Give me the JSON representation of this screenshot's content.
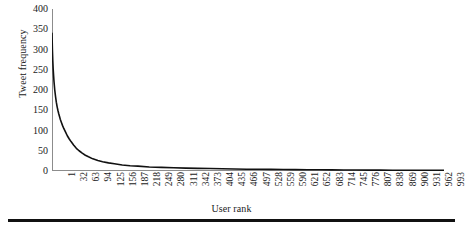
{
  "chart_data": {
    "type": "line",
    "title": "",
    "xlabel": "User rank",
    "ylabel": "Tweet frequency",
    "ylim": [
      0,
      400
    ],
    "xlim": [
      1,
      1000
    ],
    "grid": false,
    "legend": null,
    "yticks": [
      0,
      50,
      100,
      150,
      200,
      250,
      300,
      350,
      400
    ],
    "ytick_labels": [
      "0",
      "50",
      "100",
      "150",
      "200",
      "250",
      "300",
      "350",
      "400"
    ],
    "xtick_labels": [
      "1",
      "32",
      "63",
      "94",
      "125",
      "156",
      "187",
      "218",
      "249",
      "280",
      "311",
      "342",
      "373",
      "404",
      "435",
      "466",
      "497",
      "528",
      "559",
      "590",
      "621",
      "652",
      "683",
      "714",
      "745",
      "776",
      "807",
      "838",
      "869",
      "900",
      "931",
      "962",
      "993"
    ],
    "xtick_values": [
      1,
      32,
      63,
      94,
      125,
      156,
      187,
      218,
      249,
      280,
      311,
      342,
      373,
      404,
      435,
      466,
      497,
      528,
      559,
      590,
      621,
      652,
      683,
      714,
      745,
      776,
      807,
      838,
      869,
      900,
      931,
      962,
      993
    ],
    "series": [
      {
        "name": "Tweet frequency by user rank",
        "color": "#111111",
        "line_width": 1.6,
        "x": [
          1,
          2,
          3,
          4,
          5,
          6,
          8,
          10,
          12,
          14,
          16,
          18,
          20,
          22,
          25,
          28,
          31,
          35,
          40,
          45,
          50,
          56,
          63,
          70,
          78,
          86,
          94,
          105,
          118,
          130,
          145,
          160,
          180,
          200,
          220,
          249,
          280,
          311,
          342,
          373,
          404,
          435,
          466,
          497,
          528,
          559,
          590,
          621,
          652,
          683,
          714,
          745,
          776,
          807,
          838,
          869,
          900,
          931,
          962,
          993,
          1000
        ],
        "y": [
          340,
          300,
          272,
          252,
          236,
          222,
          200,
          184,
          170,
          159,
          150,
          142,
          135,
          128,
          120,
          112,
          105,
          97,
          87,
          79,
          72,
          64,
          56,
          50,
          44,
          39,
          35,
          30,
          26,
          23,
          20,
          18,
          15,
          13,
          12,
          10,
          9,
          8,
          7,
          6.5,
          6,
          5.5,
          5,
          4.5,
          4.2,
          4,
          3.7,
          3.5,
          3.2,
          3,
          2.8,
          2.6,
          2.4,
          2.2,
          2.1,
          2,
          1.9,
          1.8,
          1.7,
          1.6,
          1.5
        ]
      }
    ]
  },
  "axis": {
    "spine_color": "#8c8c8c",
    "text_color": "#1a1a1a"
  },
  "rule": {
    "color": "#111111"
  }
}
